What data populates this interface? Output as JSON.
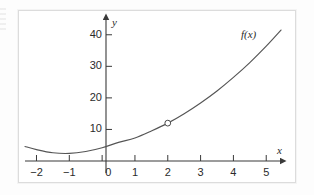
{
  "figure": {
    "background_color": "#fdfdfd",
    "plot_background_color": "#ffffff",
    "frame_color": "#dcdcdc"
  },
  "chart_data": {
    "type": "line",
    "title": "",
    "subtitle": "",
    "xlabel": "x",
    "ylabel": "y",
    "curve_label": "f(x)",
    "grid": false,
    "legend_position": "none",
    "axis_style": "cartesian-arrows",
    "curve_color": "#555555",
    "xlim": [
      -2.35,
      5.45
    ],
    "ylim": [
      -4,
      45
    ],
    "xticks": [
      -2,
      -1,
      0,
      1,
      2,
      3,
      4,
      5
    ],
    "xtick_labels": [
      "−2",
      "−1",
      "0",
      "1",
      "2",
      "3",
      "4",
      "5"
    ],
    "yticks": [
      10,
      20,
      30,
      40
    ],
    "ytick_labels": [
      "10",
      "20",
      "30",
      "40"
    ],
    "x": [
      -2.35,
      -2,
      -1.5,
      -1,
      -0.5,
      0,
      0.5,
      1,
      1.5,
      2,
      2.5,
      3,
      3.5,
      4,
      4.5,
      5,
      5.45
    ],
    "y": [
      4.6,
      3.6,
      2.6,
      2.4,
      3.0,
      4.2,
      5.9,
      7.3,
      9.5,
      12.0,
      15.0,
      18.4,
      22.2,
      26.5,
      31.2,
      36.4,
      41.5
    ],
    "annotations": [
      {
        "kind": "open-circle",
        "x": 2,
        "y": 12,
        "label": "",
        "filled": false
      }
    ],
    "series": [
      {
        "name": "f(x)",
        "x": [
          -2.35,
          -2,
          -1.5,
          -1,
          -0.5,
          0,
          0.5,
          1,
          1.5,
          2,
          2.5,
          3,
          3.5,
          4,
          4.5,
          5,
          5.45
        ],
        "values": [
          4.6,
          3.6,
          2.6,
          2.4,
          3.0,
          4.2,
          5.9,
          7.3,
          9.5,
          12.0,
          15.0,
          18.4,
          22.2,
          26.5,
          31.2,
          36.4,
          41.5
        ]
      }
    ]
  }
}
